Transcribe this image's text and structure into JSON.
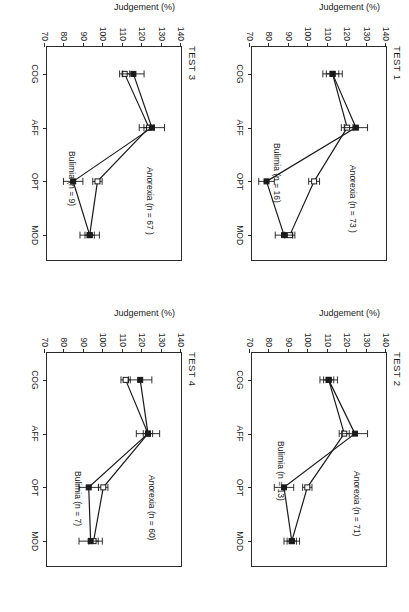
{
  "figure": {
    "orientation": "rotated-90",
    "ylabel": "Judgement (%)",
    "categories": [
      "COG",
      "AFF",
      "OPT",
      "MOD"
    ],
    "yticks": [
      140,
      130,
      120,
      110,
      100,
      90,
      80,
      70
    ],
    "ylim": [
      70,
      140
    ],
    "colors": {
      "ink": "#1a1a1a",
      "frame": "#2b2b2b"
    }
  },
  "panels": [
    {
      "key": "test1",
      "title": "TEST 1",
      "anorexia_note": "Anorexia (n = 73 )",
      "bulimia_note": "Bulimia (n = 16)",
      "note_pos": {
        "anorexia_x": 118,
        "anorexia_y": 28,
        "bulimia_x": 96,
        "bulimia_y": 104
      },
      "chart_data": {
        "type": "line",
        "title": "TEST 1",
        "xlabel": "",
        "ylabel": "Judgement (%)",
        "categories": [
          "COG",
          "AFF",
          "OPT",
          "MOD"
        ],
        "ylim": [
          70,
          140
        ],
        "yticks": [
          140,
          130,
          120,
          110,
          100,
          90,
          80,
          70
        ],
        "grid": false,
        "legend": "inline-annotation",
        "series": [
          {
            "name": "Anorexia (n = 73 )",
            "marker": "open-square",
            "values": [
              112.5,
              120.0,
              103.0,
              90.5
            ],
            "errors": [
              3.2,
              3.0,
              2.8,
              2.6
            ]
          },
          {
            "name": "Bulimia (n = 16)",
            "marker": "filled-square",
            "values": [
              112.5,
              124.5,
              78.5,
              87.5
            ],
            "errors": [
              5.0,
              6.0,
              4.0,
              4.5
            ]
          }
        ]
      }
    },
    {
      "key": "test2",
      "title": "TEST 2",
      "anorexia_note": "Anorexia (n = 71)",
      "bulimia_note": "Bulimia (n = 13)",
      "note_pos": {
        "anorexia_x": 118,
        "anorexia_y": 24,
        "bulimia_x": 88,
        "bulimia_y": 100
      },
      "chart_data": {
        "type": "line",
        "title": "TEST 2",
        "xlabel": "",
        "ylabel": "Judgement (%)",
        "categories": [
          "COG",
          "AFF",
          "OPT",
          "MOD"
        ],
        "ylim": [
          70,
          140
        ],
        "yticks": [
          140,
          130,
          120,
          110,
          100,
          90,
          80,
          70
        ],
        "grid": false,
        "legend": "inline-annotation",
        "series": [
          {
            "name": "Anorexia (n = 71)",
            "marker": "open-square",
            "values": [
              110.5,
              118.5,
              99.5,
              91.5
            ],
            "errors": [
              2.6,
              2.6,
              2.4,
              2.4
            ]
          },
          {
            "name": "Bulimia (n = 13)",
            "marker": "filled-square",
            "values": [
              110.5,
              124.0,
              87.5,
              91.5
            ],
            "errors": [
              4.5,
              6.5,
              5.0,
              4.0
            ]
          }
        ]
      }
    },
    {
      "key": "test3",
      "title": "TEST 3",
      "anorexia_note": "Anorexia (n = 67 )",
      "bulimia_note": "Bulimia (n = 9)",
      "note_pos": {
        "anorexia_x": 120,
        "anorexia_y": 26,
        "bulimia_x": 104,
        "bulimia_y": 104
      },
      "chart_data": {
        "type": "line",
        "title": "TEST 3",
        "xlabel": "",
        "ylabel": "Judgement (%)",
        "categories": [
          "COG",
          "AFF",
          "OPT",
          "MOD"
        ],
        "ylim": [
          70,
          140
        ],
        "yticks": [
          140,
          130,
          120,
          110,
          100,
          90,
          80,
          70
        ],
        "grid": false,
        "legend": "inline-annotation",
        "series": [
          {
            "name": "Anorexia (n = 67 )",
            "marker": "open-square",
            "values": [
              111.0,
              123.5,
              97.0,
              93.0
            ],
            "errors": [
              2.6,
              2.6,
              2.4,
              2.4
            ]
          },
          {
            "name": "Bulimia (n = 9)",
            "marker": "filled-square",
            "values": [
              115.5,
              125.0,
              84.5,
              93.0
            ],
            "errors": [
              5.5,
              6.5,
              5.0,
              5.0
            ]
          }
        ]
      }
    },
    {
      "key": "test4",
      "title": "TEST 4",
      "anorexia_note": "Anorexia (n = 60)",
      "bulimia_note": "Bulimia (n = 7)",
      "note_pos": {
        "anorexia_x": 122,
        "anorexia_y": 24,
        "bulimia_x": 118,
        "bulimia_y": 98
      },
      "chart_data": {
        "type": "line",
        "title": "TEST 4",
        "xlabel": "",
        "ylabel": "Judgement (%)",
        "categories": [
          "COG",
          "AFF",
          "OPT",
          "MOD"
        ],
        "ylim": [
          70,
          140
        ],
        "yticks": [
          140,
          130,
          120,
          110,
          100,
          90,
          80,
          70
        ],
        "grid": false,
        "legend": "inline-annotation",
        "series": [
          {
            "name": "Anorexia (n = 60)",
            "marker": "open-square",
            "values": [
              111.5,
              123.0,
              100.0,
              95.0
            ],
            "errors": [
              2.4,
              2.4,
              2.4,
              2.4
            ]
          },
          {
            "name": "Bulimia (n = 7)",
            "marker": "filled-square",
            "values": [
              119.0,
              123.0,
              92.5,
              93.5
            ],
            "errors": [
              6.0,
              6.0,
              5.0,
              6.0
            ]
          }
        ]
      }
    }
  ]
}
